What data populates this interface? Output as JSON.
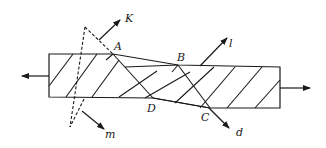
{
  "diagram": {
    "title": "",
    "labels": {
      "A": "A",
      "B": "B",
      "C": "C",
      "D": "D",
      "K": "K",
      "m": "m",
      "l": "l",
      "d": "d"
    },
    "colors": {
      "ink": "#1a1a1a",
      "background": "#ffffff"
    }
  }
}
